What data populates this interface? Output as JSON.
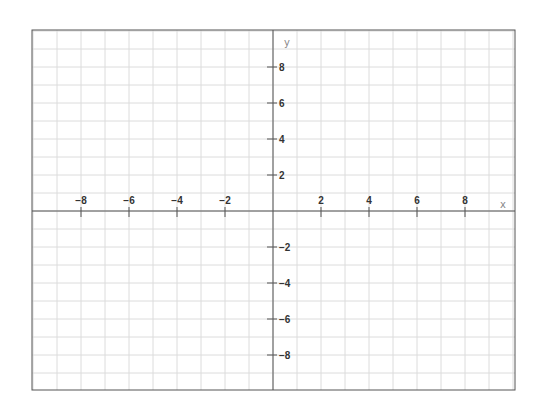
{
  "chart_data": {
    "type": "scatter",
    "title": "",
    "xlabel": "x",
    "ylabel": "y",
    "xlim": [
      -10,
      10
    ],
    "ylim": [
      -10,
      10
    ],
    "grid": true,
    "grid_step": 1,
    "x_ticks": [
      -8,
      -6,
      -4,
      -2,
      2,
      4,
      6,
      8
    ],
    "x_tick_labels": [
      "−8",
      "−6",
      "−4",
      "−2",
      "2",
      "4",
      "6",
      "8"
    ],
    "y_ticks": [
      8,
      6,
      4,
      2,
      -2,
      -4,
      -6,
      -8
    ],
    "y_tick_labels": [
      "8",
      "6",
      "4",
      "2",
      "−2",
      "−4",
      "−6",
      "−8"
    ],
    "series": [],
    "legend": null
  },
  "colors": {
    "grid": "#dcdcdc",
    "axis": "#555555",
    "frame": "#555555",
    "tick_label": "#333333",
    "axis_label": "#888888"
  }
}
